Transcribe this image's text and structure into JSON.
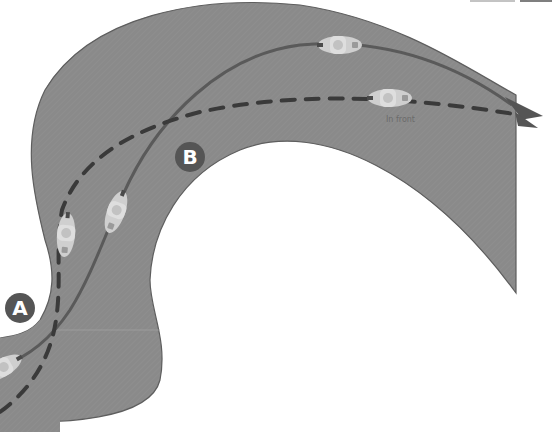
{
  "diagram": {
    "colors": {
      "background": "#ffffff",
      "road": "#8a8a8a",
      "road_edge": "#5e5e5e",
      "solid_line": "#5a5a5a",
      "dashed_line": "#3a3a3a",
      "badge": "#555555",
      "bike": "#cfcfcf"
    },
    "badges": [
      {
        "id": "A",
        "label": "A"
      },
      {
        "id": "B",
        "label": "B"
      }
    ],
    "annotations": [
      {
        "id": "in-front",
        "text": "In front"
      }
    ],
    "paths": [
      {
        "id": "solid-line",
        "style": "solid",
        "description": "Line of lead rider"
      },
      {
        "id": "dashed-line",
        "style": "dashed",
        "description": "Line of following rider"
      }
    ],
    "bikes": [
      {
        "id": "bike-solid-1",
        "path": "solid"
      },
      {
        "id": "bike-solid-2",
        "path": "solid"
      },
      {
        "id": "bike-solid-3",
        "path": "solid"
      },
      {
        "id": "bike-dashed-1",
        "path": "dashed"
      },
      {
        "id": "bike-dashed-2",
        "path": "dashed"
      }
    ]
  }
}
